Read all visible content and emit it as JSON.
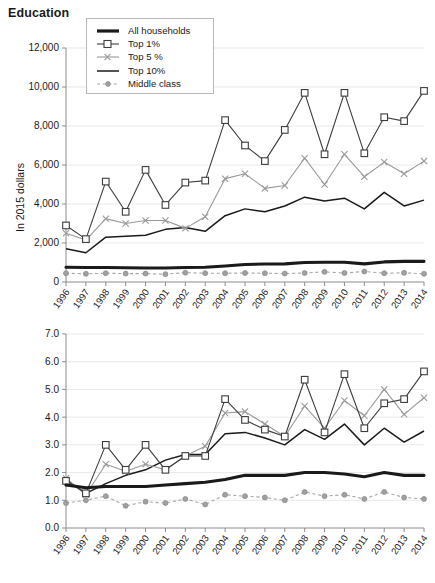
{
  "chart_title": "Education",
  "legend": {
    "position": "top-left-inside",
    "items": [
      {
        "label": "All households",
        "key": "thick-black-line",
        "color": "#1a1a1a"
      },
      {
        "label": "Top 1%",
        "key": "line-square-marker",
        "color": "#3d3d3d"
      },
      {
        "label": "Top 5 %",
        "key": "line-x-marker",
        "color": "#9a9a9a"
      },
      {
        "label": "Top 10%",
        "key": "thin-black-line",
        "color": "#1a1a1a"
      },
      {
        "label": "Middle class",
        "key": "dotted-line-dot-marker",
        "color": "#a0a0a0"
      }
    ]
  },
  "chart_data": [
    {
      "type": "line",
      "id": "education-dollars",
      "title": "Education",
      "xlabel": "",
      "ylabel": "In 2015 dollars",
      "categories": [
        "1996",
        "1997",
        "1998",
        "1999",
        "2000",
        "2001",
        "2002",
        "2003",
        "2004",
        "2005",
        "2006",
        "2007",
        "2008",
        "2009",
        "2010",
        "2011",
        "2012",
        "2013",
        "2014"
      ],
      "ylim": [
        0,
        12000
      ],
      "ytick_values": [
        0,
        2000,
        4000,
        6000,
        8000,
        10000,
        12000
      ],
      "ytick_labels": [
        "0",
        "2,000",
        "4,000",
        "6,000",
        "8,000",
        "10,000",
        "12,000"
      ],
      "grid": true,
      "series": [
        {
          "name": "All households",
          "values": [
            760,
            740,
            740,
            730,
            720,
            720,
            740,
            760,
            820,
            900,
            920,
            930,
            1000,
            1010,
            1010,
            930,
            1030,
            1060,
            1060
          ]
        },
        {
          "name": "Top 1%",
          "values": [
            2900,
            2200,
            5150,
            3600,
            5750,
            3950,
            5100,
            5200,
            8300,
            7000,
            6200,
            7800,
            9700,
            6550,
            9700,
            6600,
            8450,
            8250,
            9800
          ]
        },
        {
          "name": "Top 5 %",
          "values": [
            2500,
            2150,
            3250,
            3000,
            3150,
            3150,
            2750,
            3350,
            5300,
            5550,
            4800,
            4950,
            6350,
            5000,
            6550,
            5400,
            6150,
            5550,
            6200
          ]
        },
        {
          "name": "Top 10%",
          "values": [
            1700,
            1500,
            2300,
            2350,
            2400,
            2700,
            2800,
            2600,
            3400,
            3750,
            3600,
            3900,
            4350,
            4150,
            4300,
            3750,
            4600,
            3900,
            4200
          ]
        },
        {
          "name": "Middle class",
          "values": [
            450,
            420,
            450,
            430,
            430,
            400,
            480,
            450,
            450,
            460,
            450,
            430,
            460,
            520,
            460,
            540,
            450,
            470,
            420
          ]
        }
      ]
    },
    {
      "type": "line",
      "id": "education-share",
      "title": "",
      "xlabel": "",
      "ylabel": "Share of total expenditures (%)",
      "categories": [
        "1996",
        "1997",
        "1998",
        "1999",
        "2000",
        "2001",
        "2002",
        "2003",
        "2004",
        "2005",
        "2006",
        "2007",
        "2008",
        "2009",
        "2010",
        "2011",
        "2012",
        "2013",
        "2014"
      ],
      "ylim": [
        0.0,
        7.0
      ],
      "ytick_values": [
        0.0,
        1.0,
        2.0,
        3.0,
        4.0,
        5.0,
        6.0,
        7.0
      ],
      "ytick_labels": [
        "0.0",
        "1.0",
        "2.0",
        "3.0",
        "4.0",
        "5.0",
        "6.0",
        "7.0"
      ],
      "grid": true,
      "series": [
        {
          "name": "All households",
          "values": [
            1.55,
            1.45,
            1.5,
            1.5,
            1.5,
            1.55,
            1.6,
            1.65,
            1.75,
            1.9,
            1.9,
            1.9,
            2.0,
            2.0,
            1.95,
            1.85,
            2.0,
            1.9,
            1.9
          ]
        },
        {
          "name": "Top 1%",
          "values": [
            1.7,
            1.25,
            3.0,
            2.1,
            3.0,
            2.1,
            2.6,
            2.6,
            4.65,
            3.9,
            3.55,
            3.3,
            5.35,
            3.45,
            5.55,
            3.6,
            4.5,
            4.65,
            5.65
          ]
        },
        {
          "name": "Top 5 %",
          "values": [
            1.8,
            1.2,
            2.3,
            2.05,
            2.3,
            2.1,
            2.6,
            2.95,
            4.15,
            4.2,
            3.75,
            3.3,
            4.4,
            3.6,
            4.6,
            4.05,
            5.0,
            4.1,
            4.7
          ]
        },
        {
          "name": "Top 10%",
          "values": [
            1.75,
            1.25,
            1.6,
            1.9,
            2.1,
            2.45,
            2.65,
            2.65,
            3.4,
            3.45,
            3.25,
            3.0,
            3.55,
            3.2,
            3.75,
            3.0,
            3.6,
            3.1,
            3.5
          ]
        },
        {
          "name": "Middle class",
          "values": [
            0.9,
            1.0,
            1.15,
            0.8,
            0.95,
            0.9,
            1.05,
            0.85,
            1.2,
            1.15,
            1.1,
            1.0,
            1.3,
            1.15,
            1.2,
            1.05,
            1.3,
            1.1,
            1.05
          ]
        }
      ]
    }
  ]
}
